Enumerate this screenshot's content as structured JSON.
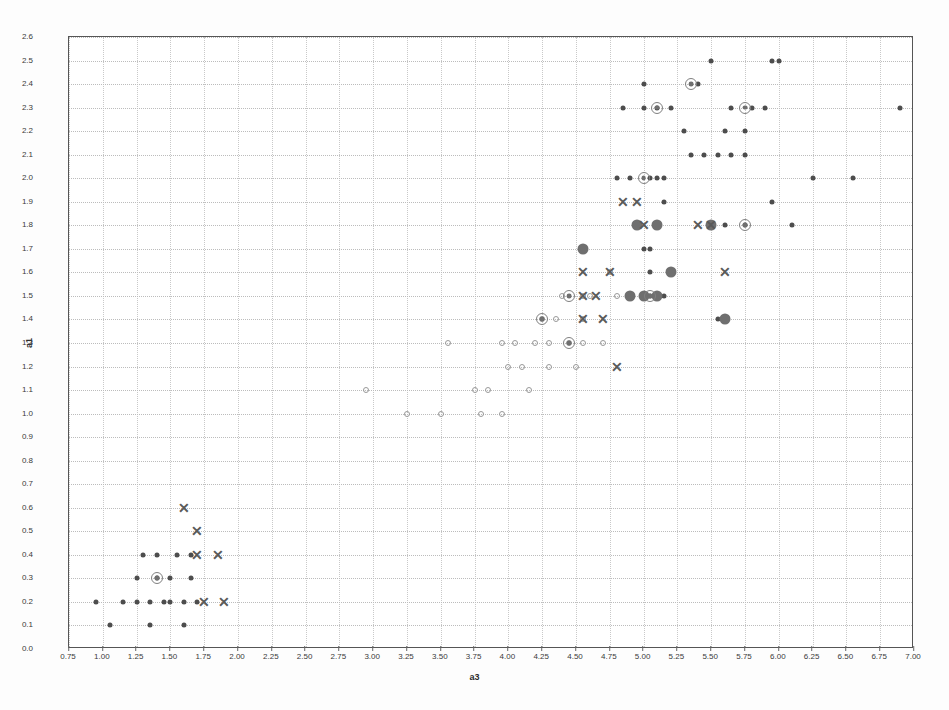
{
  "chart_data": {
    "type": "scatter",
    "title": "",
    "xlabel": "a3",
    "ylabel": "a1",
    "xlim": [
      0.75,
      7.0
    ],
    "ylim": [
      0.0,
      2.6
    ],
    "grid": true,
    "legend_position": "none",
    "xticks": [
      "0.75",
      "1.00",
      "1.25",
      "1.50",
      "1.75",
      "2.00",
      "2.25",
      "2.50",
      "2.75",
      "3.00",
      "3.25",
      "3.50",
      "3.75",
      "4.00",
      "4.25",
      "4.50",
      "4.75",
      "5.00",
      "5.25",
      "5.50",
      "5.75",
      "6.00",
      "6.25",
      "6.50",
      "6.75",
      "7.00"
    ],
    "xtick_values": [
      0.75,
      1.0,
      1.25,
      1.5,
      1.75,
      2.0,
      2.25,
      2.5,
      2.75,
      3.0,
      3.25,
      3.5,
      3.75,
      4.0,
      4.25,
      4.5,
      4.75,
      5.0,
      5.25,
      5.5,
      5.75,
      6.0,
      6.25,
      6.5,
      6.75,
      7.0
    ],
    "yticks": [
      "0.0",
      "0.1",
      "0.2",
      "0.3",
      "0.4",
      "0.5",
      "0.6",
      "0.7",
      "0.8",
      "0.9",
      "1.0",
      "1.1",
      "1.2",
      "1.3",
      "1.4",
      "1.5",
      "1.6",
      "1.7",
      "1.8",
      "1.9",
      "2.0",
      "2.1",
      "2.2",
      "2.3",
      "2.4",
      "2.5",
      "2.6"
    ],
    "ytick_values": [
      0.0,
      0.1,
      0.2,
      0.3,
      0.4,
      0.5,
      0.6,
      0.7,
      0.8,
      0.9,
      1.0,
      1.1,
      1.2,
      1.3,
      1.4,
      1.5,
      1.6,
      1.7,
      1.8,
      1.9,
      2.0,
      2.1,
      2.2,
      2.3,
      2.4,
      2.5,
      2.6
    ],
    "colors": {
      "dot": "#4d4d4d",
      "hollow": "#9a9a9a",
      "bigdot": "#6f6f6f",
      "ring": "#808080",
      "cross": "#5a5a5a",
      "grid": "#cccccc",
      "frame": "#555555"
    },
    "series": [
      {
        "name": "dot",
        "marker": "filled-circle",
        "color": "#4d4d4d",
        "size": 5,
        "points": [
          [
            0.95,
            0.2
          ],
          [
            1.05,
            0.1
          ],
          [
            1.15,
            0.2
          ],
          [
            1.25,
            0.2
          ],
          [
            1.35,
            0.2
          ],
          [
            1.4,
            0.3
          ],
          [
            1.4,
            0.4
          ],
          [
            1.45,
            0.2
          ],
          [
            1.5,
            0.2
          ],
          [
            1.5,
            0.3
          ],
          [
            1.55,
            0.4
          ],
          [
            1.6,
            0.2
          ],
          [
            1.6,
            0.1
          ],
          [
            1.65,
            0.4
          ],
          [
            1.65,
            0.3
          ],
          [
            1.7,
            0.2
          ],
          [
            1.3,
            0.4
          ],
          [
            1.35,
            0.1
          ],
          [
            1.25,
            0.3
          ],
          [
            4.8,
            2.0
          ],
          [
            4.9,
            2.0
          ],
          [
            5.05,
            2.0
          ],
          [
            5.1,
            2.0
          ],
          [
            5.15,
            2.0
          ],
          [
            5.0,
            2.4
          ],
          [
            5.4,
            2.4
          ],
          [
            5.5,
            2.5
          ],
          [
            5.95,
            2.5
          ],
          [
            6.0,
            2.5
          ],
          [
            4.85,
            2.3
          ],
          [
            5.0,
            2.3
          ],
          [
            5.1,
            2.3
          ],
          [
            5.2,
            2.3
          ],
          [
            5.65,
            2.3
          ],
          [
            5.8,
            2.3
          ],
          [
            5.9,
            2.3
          ],
          [
            6.9,
            2.3
          ],
          [
            5.3,
            2.2
          ],
          [
            5.6,
            2.2
          ],
          [
            5.75,
            2.2
          ],
          [
            5.35,
            2.1
          ],
          [
            5.45,
            2.1
          ],
          [
            5.55,
            2.1
          ],
          [
            5.65,
            2.1
          ],
          [
            5.75,
            2.1
          ],
          [
            6.25,
            2.0
          ],
          [
            6.55,
            2.0
          ],
          [
            5.15,
            1.9
          ],
          [
            5.95,
            1.9
          ],
          [
            5.5,
            1.8
          ],
          [
            5.6,
            1.8
          ],
          [
            5.75,
            1.8
          ],
          [
            6.1,
            1.8
          ],
          [
            5.0,
            1.7
          ],
          [
            5.05,
            1.7
          ],
          [
            5.05,
            1.6
          ],
          [
            4.9,
            1.5
          ],
          [
            5.0,
            1.5
          ],
          [
            5.05,
            1.5
          ],
          [
            5.1,
            1.5
          ],
          [
            5.15,
            1.5
          ],
          [
            5.55,
            1.4
          ]
        ]
      },
      {
        "name": "hollow",
        "marker": "open-circle",
        "color": "#9a9a9a",
        "size": 6,
        "points": [
          [
            2.95,
            1.1
          ],
          [
            3.25,
            1.0
          ],
          [
            3.5,
            1.0
          ],
          [
            3.8,
            1.0
          ],
          [
            3.95,
            1.0
          ],
          [
            3.75,
            1.1
          ],
          [
            3.85,
            1.1
          ],
          [
            4.15,
            1.1
          ],
          [
            3.55,
            1.3
          ],
          [
            3.95,
            1.3
          ],
          [
            4.05,
            1.3
          ],
          [
            4.2,
            1.3
          ],
          [
            4.3,
            1.3
          ],
          [
            4.45,
            1.3
          ],
          [
            4.55,
            1.3
          ],
          [
            4.7,
            1.3
          ],
          [
            4.0,
            1.2
          ],
          [
            4.1,
            1.2
          ],
          [
            4.3,
            1.2
          ],
          [
            4.5,
            1.2
          ],
          [
            4.25,
            1.4
          ],
          [
            4.55,
            1.4
          ],
          [
            4.35,
            1.4
          ],
          [
            4.55,
            1.5
          ],
          [
            4.8,
            1.5
          ],
          [
            4.6,
            1.5
          ],
          [
            4.4,
            1.5
          ],
          [
            4.75,
            1.6
          ]
        ]
      },
      {
        "name": "bigdot",
        "marker": "large-filled-circle",
        "color": "#6f6f6f",
        "size": 11,
        "points": [
          [
            4.55,
            1.7
          ],
          [
            4.95,
            1.8
          ],
          [
            5.1,
            1.8
          ],
          [
            5.5,
            1.8
          ],
          [
            4.9,
            1.5
          ],
          [
            5.0,
            1.5
          ],
          [
            5.1,
            1.5
          ],
          [
            5.6,
            1.4
          ],
          [
            5.2,
            1.6
          ]
        ]
      },
      {
        "name": "ring",
        "marker": "bullseye",
        "color": "#808080",
        "size": 12,
        "points": [
          [
            1.4,
            0.3
          ],
          [
            4.25,
            1.4
          ],
          [
            4.45,
            1.5
          ],
          [
            4.45,
            1.3
          ],
          [
            5.0,
            2.0
          ],
          [
            5.35,
            2.4
          ],
          [
            5.1,
            2.3
          ],
          [
            5.75,
            1.8
          ],
          [
            5.75,
            2.3
          ],
          [
            5.05,
            1.5
          ]
        ]
      },
      {
        "name": "cross",
        "marker": "x",
        "color": "#5a5a5a",
        "size": 14,
        "points": [
          [
            1.6,
            0.6
          ],
          [
            1.7,
            0.5
          ],
          [
            1.7,
            0.4
          ],
          [
            1.85,
            0.4
          ],
          [
            1.75,
            0.2
          ],
          [
            1.9,
            0.2
          ],
          [
            4.55,
            1.6
          ],
          [
            4.75,
            1.6
          ],
          [
            4.55,
            1.5
          ],
          [
            4.65,
            1.5
          ],
          [
            4.55,
            1.4
          ],
          [
            4.7,
            1.4
          ],
          [
            4.8,
            1.2
          ],
          [
            4.85,
            1.9
          ],
          [
            4.95,
            1.9
          ],
          [
            5.0,
            1.8
          ],
          [
            5.4,
            1.8
          ],
          [
            5.5,
            1.8
          ],
          [
            5.6,
            1.6
          ]
        ]
      }
    ]
  }
}
